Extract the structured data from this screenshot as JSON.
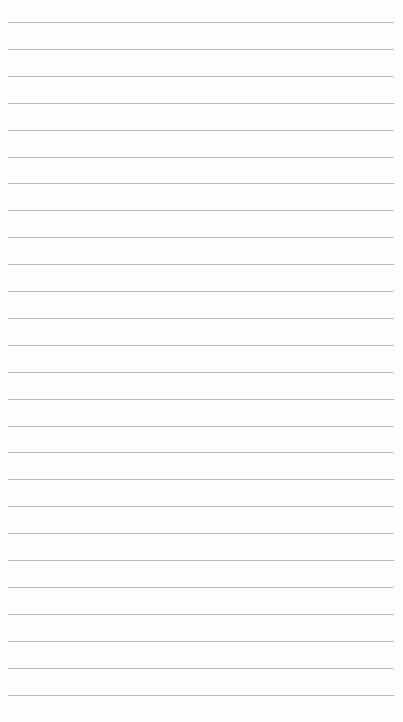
{
  "page": {
    "type": "lined-paper",
    "background": "#fefefe",
    "line_color": "#bdbdbd",
    "line_count": 26,
    "first_line_y": 22,
    "line_spacing": 26.9,
    "line_left": 8,
    "line_width": 386
  }
}
